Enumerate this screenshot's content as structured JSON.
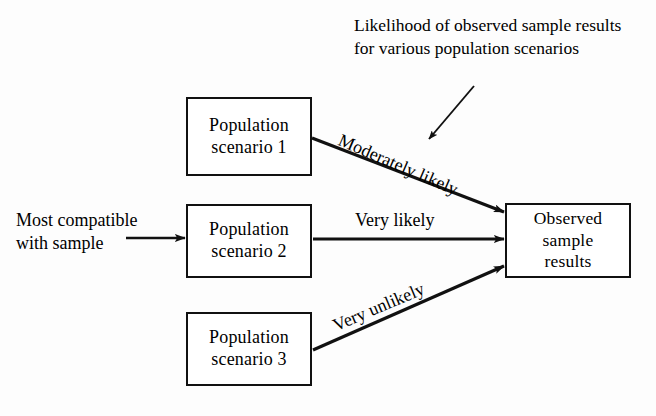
{
  "figure": {
    "background_color": "#fdfdfd",
    "line_color": "#111111"
  },
  "nodes": {
    "scenario_1": {
      "line1": "Population",
      "line2": "scenario 1"
    },
    "scenario_2": {
      "line1": "Population",
      "line2": "scenario 2"
    },
    "scenario_3": {
      "line1": "Population",
      "line2": "scenario 3"
    },
    "observed": {
      "line1": "Observed",
      "line2": "sample",
      "line3": "results"
    }
  },
  "edge_labels": {
    "moderately_likely": "Moderately likely",
    "very_likely": "Very likely",
    "very_unlikely": "Very unlikely"
  },
  "callouts": {
    "most_compatible": {
      "line1": "Most compatible",
      "line2": "with sample"
    },
    "annotation": "Likelihood of observed sample results for various population scenarios"
  }
}
